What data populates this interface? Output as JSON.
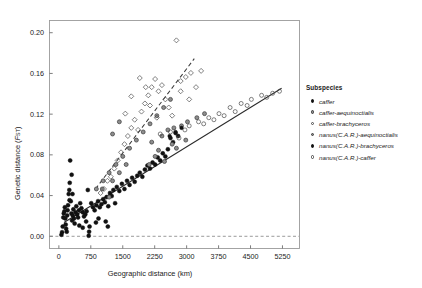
{
  "chart_data": {
    "type": "scatter",
    "title": "",
    "xlabel": "Geographic distance (km)",
    "ylabel": "Genetic distance (FST)",
    "ylabel_main": "Genetic distance (",
    "ylabel_italic": "F",
    "ylabel_sub": "ST",
    "ylabel_close": ")",
    "xlim": [
      -220,
      5650
    ],
    "ylim": [
      -0.012,
      0.212
    ],
    "xticks": [
      0,
      750,
      1500,
      2250,
      3000,
      3750,
      4500,
      5250
    ],
    "xticklabels": [
      "0",
      "750",
      "1500",
      "2250",
      "3000",
      "3750",
      "4500",
      "5250"
    ],
    "yticks": [
      0.0,
      0.04,
      0.08,
      0.12,
      0.16,
      0.2
    ],
    "yticklabels": [
      "0.00",
      "0.04",
      "0.08",
      "0.12",
      "0.16",
      "0.20"
    ],
    "grid": false,
    "legend_position": "right-outside",
    "reference_line": {
      "y": 0.0,
      "style": "dashed",
      "color": "#808080"
    },
    "trend_lines": [
      {
        "name": "solid-regression",
        "style": "solid",
        "color": "#2b2b2b",
        "x0": 120,
        "y0": 0.0135,
        "x1": 5230,
        "y1": 0.1455
      },
      {
        "name": "dashed-regression",
        "style": "dashed",
        "color": "#3a3a3a",
        "x0": 860,
        "y0": 0.0465,
        "x1": 3180,
        "y1": 0.1745
      }
    ],
    "series": [
      {
        "name": "caffer",
        "marker": "filled-circle",
        "points": [
          [
            60,
            0.0015
          ],
          [
            75,
            0.004
          ],
          [
            90,
            0.0095
          ],
          [
            105,
            0.0185
          ],
          [
            115,
            0.0225
          ],
          [
            130,
            0.0245
          ],
          [
            140,
            0.0285
          ],
          [
            150,
            0.0175
          ],
          [
            160,
            0.0115
          ],
          [
            170,
            0.0075
          ],
          [
            185,
            0.0045
          ],
          [
            195,
            0.0205
          ],
          [
            205,
            0.0255
          ],
          [
            215,
            0.0305
          ],
          [
            230,
            0.0415
          ],
          [
            245,
            0.0455
          ],
          [
            255,
            0.0525
          ],
          [
            265,
            0.0745
          ],
          [
            280,
            0.0345
          ],
          [
            295,
            0.0225
          ],
          [
            310,
            0.0155
          ],
          [
            325,
            0.0205
          ],
          [
            340,
            0.0265
          ],
          [
            355,
            0.0175
          ],
          [
            370,
            0.0125
          ],
          [
            390,
            0.0235
          ],
          [
            410,
            0.0295
          ],
          [
            430,
            0.0215
          ],
          [
            450,
            0.0185
          ],
          [
            470,
            0.0255
          ],
          [
            500,
            0.0325
          ],
          [
            530,
            0.0275
          ],
          [
            560,
            0.0235
          ],
          [
            590,
            0.0195
          ],
          [
            620,
            0.0215
          ],
          [
            650,
            0.0245
          ],
          [
            680,
            0.0455
          ],
          [
            700,
            0.0005
          ],
          [
            710,
            0.0045
          ],
          [
            720,
            0.0095
          ],
          [
            760,
            0.0325
          ],
          [
            800,
            0.0285
          ],
          [
            840,
            0.0255
          ],
          [
            880,
            0.0305
          ],
          [
            920,
            0.0345
          ],
          [
            960,
            0.0285
          ],
          [
            1000,
            0.0315
          ],
          [
            1040,
            0.0365
          ],
          [
            1080,
            0.0335
          ],
          [
            1120,
            0.0385
          ],
          [
            1160,
            0.0295
          ],
          [
            1200,
            0.0425
          ],
          [
            1240,
            0.0395
          ],
          [
            1280,
            0.0455
          ],
          [
            1320,
            0.0325
          ],
          [
            1360,
            0.0485
          ],
          [
            1420,
            0.0445
          ],
          [
            1480,
            0.0515
          ],
          [
            1540,
            0.0465
          ],
          [
            1600,
            0.0545
          ],
          [
            1660,
            0.0505
          ],
          [
            1720,
            0.0575
          ],
          [
            1780,
            0.0535
          ],
          [
            1840,
            0.0595
          ],
          [
            1900,
            0.0625
          ],
          [
            1960,
            0.0585
          ],
          [
            2020,
            0.0655
          ],
          [
            2080,
            0.0695
          ],
          [
            2140,
            0.0665
          ],
          [
            2200,
            0.0725
          ],
          [
            2260,
            0.0705
          ],
          [
            2320,
            0.0775
          ],
          [
            2380,
            0.0745
          ],
          [
            2440,
            0.0815
          ],
          [
            2500,
            0.0785
          ],
          [
            2560,
            0.0855
          ],
          [
            2620,
            0.0965
          ],
          [
            2680,
            0.0925
          ],
          [
            2740,
            0.1015
          ],
          [
            2800,
            0.0985
          ],
          [
            1100,
            0.0145
          ],
          [
            1150,
            0.0095
          ],
          [
            870,
            0.0135
          ],
          [
            930,
            0.0175
          ],
          [
            640,
            0.0145
          ],
          [
            480,
            0.0105
          ],
          [
            560,
            0.0085
          ],
          [
            300,
            0.0605
          ],
          [
            320,
            0.0415
          ],
          [
            250,
            0.0355
          ]
        ]
      },
      {
        "name": "caffer-aequinoctialis",
        "marker": "grey-circle",
        "points": [
          [
            1020,
            0.0465
          ],
          [
            1260,
            0.0545
          ],
          [
            1420,
            0.0625
          ],
          [
            1580,
            0.0705
          ],
          [
            2180,
            0.0925
          ],
          [
            2420,
            0.0985
          ],
          [
            2560,
            0.1045
          ],
          [
            2700,
            0.1065
          ],
          [
            2880,
            0.1085
          ],
          [
            3020,
            0.1125
          ],
          [
            3240,
            0.1165
          ],
          [
            2340,
            0.0845
          ],
          [
            2260,
            0.0785
          ],
          [
            2760,
            0.0865
          ],
          [
            2480,
            0.0735
          ],
          [
            1180,
            0.0385
          ],
          [
            3420,
            0.1205
          ],
          [
            2980,
            0.0945
          ],
          [
            2660,
            0.0905
          ],
          [
            2120,
            0.0705
          ]
        ]
      },
      {
        "name": "caffer-brachyceros",
        "marker": "open-circle",
        "points": [
          [
            2380,
            0.1005
          ],
          [
            2620,
            0.1025
          ],
          [
            2820,
            0.0965
          ],
          [
            3060,
            0.1085
          ],
          [
            3280,
            0.1125
          ],
          [
            3520,
            0.1165
          ],
          [
            3760,
            0.1205
          ],
          [
            4020,
            0.1265
          ],
          [
            4280,
            0.1305
          ],
          [
            4520,
            0.1345
          ],
          [
            4760,
            0.1385
          ],
          [
            5020,
            0.1405
          ],
          [
            5180,
            0.1425
          ],
          [
            4140,
            0.1225
          ],
          [
            3640,
            0.1145
          ],
          [
            2960,
            0.1045
          ],
          [
            4420,
            0.1285
          ],
          [
            4880,
            0.1365
          ],
          [
            3880,
            0.1185
          ],
          [
            3400,
            0.1105
          ]
        ]
      },
      {
        "name": "nanus(C.A.R.)-aequinoctialis",
        "marker": "grey-circle",
        "points": [
          [
            880,
            0.0465
          ],
          [
            1040,
            0.0545
          ],
          [
            1180,
            0.0625
          ],
          [
            1340,
            0.0705
          ],
          [
            1500,
            0.0785
          ],
          [
            1660,
            0.0865
          ],
          [
            1820,
            0.0945
          ],
          [
            1980,
            0.1025
          ],
          [
            2140,
            0.1105
          ],
          [
            2300,
            0.1185
          ],
          [
            2460,
            0.1265
          ],
          [
            2620,
            0.1345
          ],
          [
            1260,
            0.1005
          ],
          [
            1420,
            0.1125
          ]
        ]
      },
      {
        "name": "nanus(C.A.R.)-brachyceros",
        "marker": "filled-circle-small",
        "points": [
          [
            2600,
            0.0985
          ],
          [
            2740,
            0.1025
          ],
          [
            2880,
            0.1065
          ]
        ]
      },
      {
        "name": "nanus(C.A.R.)-caffer",
        "marker": "open-diamond",
        "points": [
          [
            980,
            0.0425
          ],
          [
            1060,
            0.0465
          ],
          [
            1140,
            0.0545
          ],
          [
            1220,
            0.0585
          ],
          [
            1300,
            0.0665
          ],
          [
            1380,
            0.0745
          ],
          [
            1460,
            0.0825
          ],
          [
            1540,
            0.0905
          ],
          [
            1620,
            0.0985
          ],
          [
            1700,
            0.1065
          ],
          [
            1780,
            0.1145
          ],
          [
            1860,
            0.1045
          ],
          [
            1940,
            0.1225
          ],
          [
            2020,
            0.1305
          ],
          [
            2100,
            0.1385
          ],
          [
            2180,
            0.1465
          ],
          [
            2260,
            0.1545
          ],
          [
            2340,
            0.1425
          ],
          [
            2420,
            0.1485
          ],
          [
            2500,
            0.1345
          ],
          [
            2580,
            0.1265
          ],
          [
            2660,
            0.1185
          ],
          [
            2760,
            0.1925
          ],
          [
            2860,
            0.1525
          ],
          [
            2980,
            0.1565
          ],
          [
            3100,
            0.1605
          ],
          [
            3220,
            0.1465
          ],
          [
            3340,
            0.1625
          ],
          [
            1900,
            0.1555
          ],
          [
            2040,
            0.1465
          ],
          [
            2140,
            0.1285
          ],
          [
            2300,
            0.1165
          ],
          [
            1700,
            0.1375
          ],
          [
            1560,
            0.1205
          ],
          [
            2860,
            0.1425
          ],
          [
            3060,
            0.1345
          ]
        ]
      }
    ]
  },
  "legend": {
    "title": "Subspecies",
    "items": [
      {
        "label": "caffer",
        "marker": "filled-circle"
      },
      {
        "label": "caffer-aequinoctialis",
        "marker": "grey-circle"
      },
      {
        "label": "caffer-brachyceros",
        "marker": "open-circle"
      },
      {
        "label": "nanus(C.A.R.)-aequinoctialis",
        "marker": "grey-circle"
      },
      {
        "label": "nanus(C.A.R.)-brachyceros",
        "marker": "filled-circle"
      },
      {
        "label": "nanus(C.A.R.)-caffer",
        "marker": "open-circle"
      }
    ]
  }
}
